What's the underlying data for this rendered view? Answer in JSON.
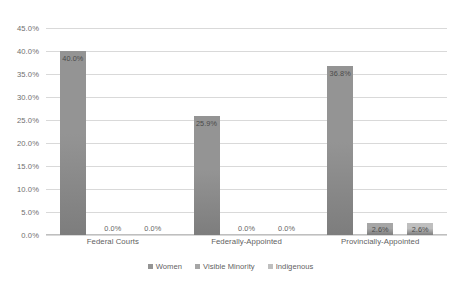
{
  "chart_data": {
    "type": "bar",
    "title": "",
    "xlabel": "",
    "ylabel": "",
    "ylim": [
      0,
      45
    ],
    "grid": true,
    "legend_position": "bottom",
    "categories": [
      "Federal Courts",
      "Federally-Appointed",
      "Provincially-Appointed"
    ],
    "ytick_labels": [
      "45.0%",
      "40.0%",
      "35.0%",
      "30.0%",
      "25.0%",
      "20.0%",
      "15.0%",
      "10.0%",
      "5.0%",
      "0.0%"
    ],
    "ytick_values": [
      45,
      40,
      35,
      30,
      25,
      20,
      15,
      10,
      5,
      0
    ],
    "series": [
      {
        "name": "Women",
        "color": "#949494",
        "values": [
          40.0,
          25.9,
          36.8
        ],
        "data_labels": [
          "40.0%",
          "25.9%",
          "36.8%"
        ]
      },
      {
        "name": "Visible Minority",
        "color": "#a6a6a6",
        "values": [
          0.0,
          0.0,
          2.6
        ],
        "data_labels": [
          "0.0%",
          "0.0%",
          "2.6%"
        ]
      },
      {
        "name": "Indigenous",
        "color": "#bfbfbf",
        "values": [
          0.0,
          0.0,
          2.6
        ],
        "data_labels": [
          "0.0%",
          "0.0%",
          "2.6%"
        ]
      }
    ]
  },
  "colors": {
    "gridline": "#d9d9d9",
    "axis": "#bfbfbf",
    "text": "#5f5f5f",
    "bar_women": "#949494",
    "bar_visible_minority": "#a6a6a6",
    "bar_indigenous": "#bfbfbf",
    "background": "#ffffff"
  }
}
